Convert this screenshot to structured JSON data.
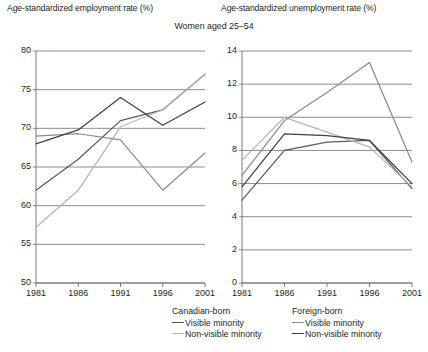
{
  "titles": {
    "left_axis_title": "Age-standardized employment rate (%)",
    "right_axis_title": "Age-standardized unemployment rate (%)",
    "main_title": "Women aged 25–54"
  },
  "legend": {
    "groups": [
      {
        "name": "canadian-born",
        "title": "Canadian-born",
        "entries": [
          {
            "label": "Visible minority",
            "color": "#58595b"
          },
          {
            "label": "Non-visible minority",
            "color": "#b5b6b8"
          }
        ]
      },
      {
        "name": "foreign-born",
        "title": "Foreign-born",
        "entries": [
          {
            "label": "Visible minority",
            "color": "#8a8c8e"
          },
          {
            "label": "Non-visible minority",
            "color": "#404041"
          }
        ]
      }
    ]
  },
  "chart_data": [
    {
      "name": "employment-rate",
      "type": "line",
      "title": "Age-standardized employment rate (%)",
      "xlabel": "",
      "ylabel": "Age-standardized employment rate (%)",
      "categories": [
        "1981",
        "1986",
        "1991",
        "1996",
        "2001"
      ],
      "x": [
        1981,
        1986,
        1991,
        1996,
        2001
      ],
      "ylim": [
        50,
        80
      ],
      "yticks": [
        50,
        55,
        60,
        65,
        70,
        75,
        80
      ],
      "grid": true,
      "legend_position": "bottom",
      "series": [
        {
          "name": "Canadian-born Visible minority",
          "color": "#58595b",
          "values": [
            62.0,
            66.0,
            71.0,
            72.4,
            77.0
          ]
        },
        {
          "name": "Canadian-born Non-visible minority",
          "color": "#b5b6b8",
          "values": [
            57.2,
            62.0,
            70.2,
            72.4,
            77.0
          ]
        },
        {
          "name": "Foreign-born Visible minority",
          "color": "#8a8c8e",
          "values": [
            69.0,
            69.3,
            68.5,
            62.0,
            66.8
          ]
        },
        {
          "name": "Foreign-born Non-visible minority",
          "color": "#404041",
          "values": [
            68.0,
            69.8,
            74.0,
            70.4,
            73.4
          ]
        }
      ]
    },
    {
      "name": "unemployment-rate",
      "type": "line",
      "title": "Age-standardized unemployment rate (%)",
      "xlabel": "",
      "ylabel": "Age-standardized unemployment rate (%)",
      "categories": [
        "1981",
        "1986",
        "1991",
        "1996",
        "2001"
      ],
      "x": [
        1981,
        1986,
        1991,
        1996,
        2001
      ],
      "ylim": [
        0,
        14
      ],
      "yticks": [
        0,
        2,
        4,
        6,
        8,
        10,
        12,
        14
      ],
      "grid": true,
      "legend_position": "bottom",
      "series": [
        {
          "name": "Canadian-born Visible minority",
          "color": "#58595b",
          "values": [
            5.0,
            8.0,
            8.5,
            8.6,
            5.7
          ]
        },
        {
          "name": "Canadian-born Non-visible minority",
          "color": "#b5b6b8",
          "values": [
            7.4,
            10.0,
            9.1,
            8.2,
            5.8
          ]
        },
        {
          "name": "Foreign-born Visible minority",
          "color": "#8a8c8e",
          "values": [
            6.5,
            9.8,
            11.5,
            13.3,
            7.3
          ]
        },
        {
          "name": "Foreign-born Non-visible minority",
          "color": "#404041",
          "values": [
            5.8,
            9.0,
            8.9,
            8.6,
            6.0
          ]
        }
      ]
    }
  ]
}
